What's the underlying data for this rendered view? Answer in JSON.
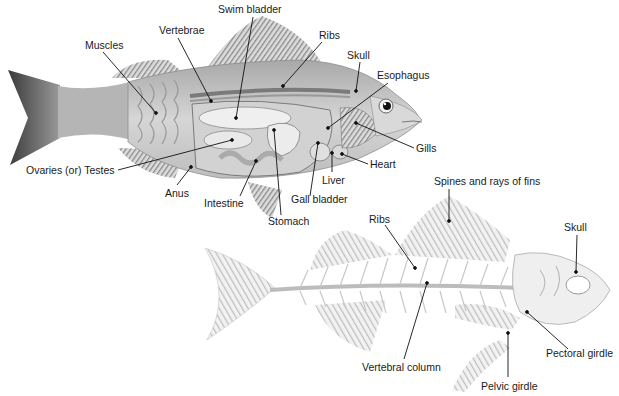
{
  "diagram": {
    "top_fish": {
      "name": "Internal anatomy of a perch",
      "labels": [
        {
          "id": "swim-bladder",
          "text": "Swim bladder",
          "x": 218,
          "y": 3,
          "lx": 253,
          "ly": 17,
          "px": 236,
          "py": 118
        },
        {
          "id": "vertebrae",
          "text": "Vertebrae",
          "x": 159,
          "y": 24,
          "lx": 178,
          "ly": 38,
          "px": 211,
          "py": 101
        },
        {
          "id": "muscles",
          "text": "Muscles",
          "x": 85,
          "y": 39,
          "lx": 103,
          "ly": 52,
          "px": 156,
          "py": 113
        },
        {
          "id": "ribs",
          "text": "Ribs",
          "x": 319,
          "y": 29,
          "lx": 322,
          "ly": 42,
          "px": 283,
          "py": 86
        },
        {
          "id": "skull",
          "text": "Skull",
          "x": 347,
          "y": 49,
          "lx": 360,
          "ly": 62,
          "px": 356,
          "py": 91
        },
        {
          "id": "esophagus",
          "text": "Esophagus",
          "x": 377,
          "y": 69,
          "lx": 388,
          "ly": 83,
          "px": 328,
          "py": 128
        },
        {
          "id": "gills",
          "text": "Gills",
          "x": 416,
          "y": 142,
          "lx": 414,
          "ly": 148,
          "px": 356,
          "py": 123
        },
        {
          "id": "heart",
          "text": "Heart",
          "x": 370,
          "y": 158,
          "lx": 368,
          "ly": 164,
          "px": 342,
          "py": 154
        },
        {
          "id": "liver",
          "text": "Liver",
          "x": 322,
          "y": 174,
          "lx": 332,
          "ly": 172,
          "px": 332,
          "py": 153
        },
        {
          "id": "gall-bladder",
          "text": "Gall bladder",
          "x": 291,
          "y": 193,
          "lx": 310,
          "ly": 196,
          "px": 318,
          "py": 143
        },
        {
          "id": "stomach",
          "text": "Stomach",
          "x": 268,
          "y": 215,
          "lx": 281,
          "ly": 215,
          "px": 274,
          "py": 130
        },
        {
          "id": "intestine",
          "text": "Intestine",
          "x": 204,
          "y": 197,
          "lx": 240,
          "ly": 196,
          "px": 256,
          "py": 161
        },
        {
          "id": "anus",
          "text": "Anus",
          "x": 165,
          "y": 187,
          "lx": 177,
          "ly": 185,
          "px": 191,
          "py": 167
        },
        {
          "id": "ovaries-testes",
          "text": "Ovaries (or) Testes",
          "x": 26,
          "y": 164,
          "lx": 118,
          "ly": 170,
          "px": 232,
          "py": 140
        }
      ]
    },
    "bottom_fish": {
      "name": "Skeleton of a perch",
      "labels": [
        {
          "id": "spines-rays",
          "text": "Spines and rays of fins",
          "x": 434,
          "y": 175,
          "lx": 449,
          "ly": 189,
          "px": 449,
          "py": 221
        },
        {
          "id": "ribs-skeleton",
          "text": "Ribs",
          "x": 369,
          "y": 213,
          "lx": 385,
          "ly": 225,
          "px": 415,
          "py": 268
        },
        {
          "id": "skull-skeleton",
          "text": "Skull",
          "x": 564,
          "y": 221,
          "lx": 577,
          "ly": 235,
          "px": 576,
          "py": 272
        },
        {
          "id": "vertebral-column",
          "text": "Vertebral column",
          "x": 362,
          "y": 361,
          "lx": 404,
          "ly": 359,
          "px": 427,
          "py": 283
        },
        {
          "id": "pectoral-girdle",
          "text": "Pectoral girdle",
          "x": 546,
          "y": 347,
          "lx": 568,
          "ly": 349,
          "px": 527,
          "py": 312
        },
        {
          "id": "pelvic-girdle",
          "text": "Pelvic girdle",
          "x": 481,
          "y": 380,
          "lx": 508,
          "ly": 377,
          "px": 508,
          "py": 333
        }
      ]
    }
  },
  "colors": {
    "text": "#1a1a1a",
    "leader": "#111111",
    "fin_light": "#d8d8d8",
    "fin_dark": "#6a6a6a",
    "body": "#c9c9c9",
    "organ": "#e4e4e4",
    "bone": "#ececec"
  }
}
